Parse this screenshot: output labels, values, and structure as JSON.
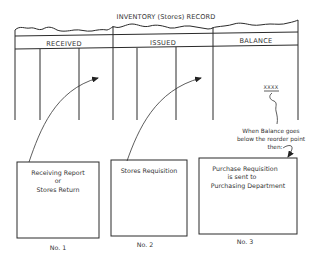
{
  "record": {
    "title": "INVENTORY (Stores) RECORD",
    "columns": [
      {
        "label": "RECEIVED"
      },
      {
        "label": "ISSUED"
      },
      {
        "label": "BALANCE"
      }
    ],
    "balance_value": "XXXX"
  },
  "note": {
    "lines": [
      "When Balance goes",
      "below the reorder point",
      "then:"
    ]
  },
  "documents": [
    {
      "lines": [
        "Receiving Report",
        "or",
        "Stores Return"
      ],
      "caption": "No. 1",
      "target_column": "RECEIVED"
    },
    {
      "lines": [
        "Stores Requisition"
      ],
      "caption": "No. 2",
      "target_column": "ISSUED"
    },
    {
      "lines": [
        "Purchase Requisition",
        "is sent to",
        "Purchasing Department"
      ],
      "caption": "No. 3",
      "target_column": "BALANCE"
    }
  ],
  "colors": {
    "line": "#2a2a2a",
    "text": "#333333",
    "background": "#ffffff"
  }
}
